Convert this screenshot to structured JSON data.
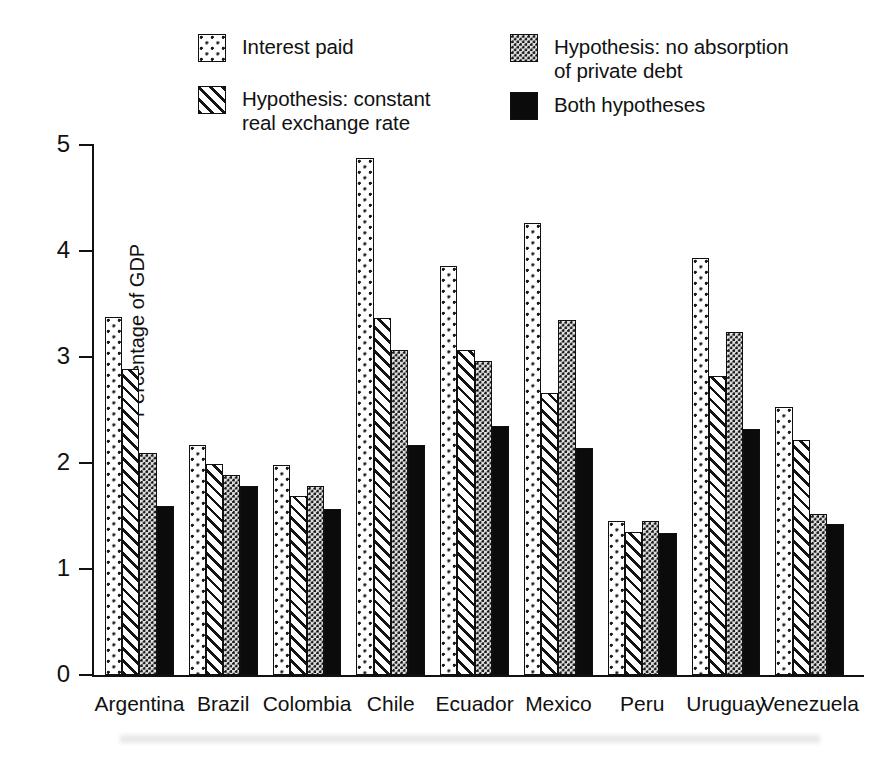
{
  "chart_data": {
    "type": "bar",
    "title": "",
    "xlabel": "",
    "ylabel": "Percentage of GDP",
    "ylim": [
      0,
      5
    ],
    "yticks": [
      0,
      1,
      2,
      3,
      4,
      5
    ],
    "ytick_labels": [
      "0",
      "1",
      "2",
      "3",
      "4",
      "5"
    ],
    "grid": false,
    "legend_position": "top",
    "categories": [
      "Argentina",
      "Brazil",
      "Colombia",
      "Chile",
      "Ecuador",
      "Mexico",
      "Peru",
      "Uruguay",
      "Venezuela"
    ],
    "series": [
      {
        "name": "Interest paid",
        "pattern": "sparse-dots",
        "values": [
          3.38,
          2.17,
          1.98,
          4.88,
          3.86,
          4.26,
          1.45,
          3.93,
          2.53
        ]
      },
      {
        "name": "Hypothesis: constant\nreal exchange rate",
        "pattern": "diagonal-hatch",
        "values": [
          2.89,
          1.99,
          1.69,
          3.37,
          3.07,
          2.66,
          1.35,
          2.82,
          2.22
        ]
      },
      {
        "name": "Hypothesis: no absorption\nof private debt",
        "pattern": "dense-dots",
        "values": [
          2.09,
          1.89,
          1.78,
          3.07,
          2.96,
          3.35,
          1.45,
          3.24,
          1.52
        ]
      },
      {
        "name": "Both hypotheses",
        "pattern": "solid-black",
        "values": [
          1.59,
          1.78,
          1.57,
          2.17,
          2.35,
          2.14,
          1.34,
          2.32,
          1.42
        ]
      }
    ]
  },
  "legend": {
    "entries": [
      {
        "label": "Interest paid",
        "pattern": "sparse-dots"
      },
      {
        "label": "Hypothesis: constant\nreal exchange rate",
        "pattern": "diagonal-hatch"
      },
      {
        "label": "Hypothesis: no absorption\nof private debt",
        "pattern": "dense-dots"
      },
      {
        "label": "Both hypotheses",
        "pattern": "solid-black"
      }
    ]
  },
  "axes": {
    "y_title": "Percentage of GDP",
    "y_labels": [
      "0",
      "1",
      "2",
      "3",
      "4",
      "5"
    ],
    "x_labels": [
      "Argentina",
      "Brazil",
      "Colombia",
      "Chile",
      "Ecuador",
      "Mexico",
      "Peru",
      "Uruguay",
      "Venezuela"
    ]
  },
  "colors": {
    "ink": "#111111",
    "fill_black": "#0b0b0b",
    "fill_grey": "#e0e0e0",
    "background": "#ffffff"
  }
}
